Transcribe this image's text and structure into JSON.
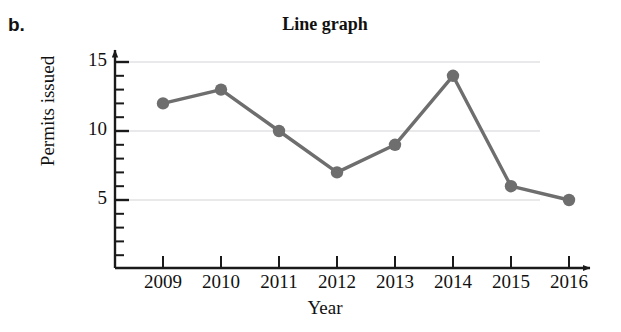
{
  "panel": {
    "label": "b."
  },
  "chart_data": {
    "type": "line",
    "title": "Line graph",
    "xlabel": "Year",
    "ylabel": "Permits issued",
    "categories": [
      "2009",
      "2010",
      "2011",
      "2012",
      "2013",
      "2014",
      "2015",
      "2016"
    ],
    "values": [
      12,
      13,
      10,
      7,
      9,
      14,
      6,
      5
    ],
    "series": [
      {
        "name": "Permits issued",
        "values": [
          12,
          13,
          10,
          7,
          9,
          14,
          6,
          5
        ]
      }
    ],
    "ylim": [
      0,
      15
    ],
    "ytick_labels": [
      "5",
      "10",
      "15"
    ],
    "ytick_values": [
      5,
      10,
      15
    ],
    "yminor_step": 1,
    "grid": true,
    "grid_axis": "y",
    "legend": "none",
    "axis_arrows": true,
    "marker": "circle",
    "colors": {
      "line": "#6e6e6e",
      "marker": "#6e6e6e",
      "axis": "#1a1a1a",
      "grid": "#e2e2e6",
      "text": "#111111",
      "background": "#ffffff"
    }
  }
}
